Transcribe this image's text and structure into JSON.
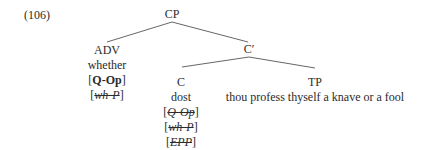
{
  "example_number": "(106)",
  "tree": {
    "root": "CP",
    "adv": {
      "label": "ADV",
      "word": "whether",
      "features": [
        {
          "text": "Q-Op",
          "style": "bold"
        },
        {
          "text": "wh-P",
          "style": "italic-struck"
        }
      ]
    },
    "cbar": "C′",
    "c": {
      "label": "C",
      "word": "dost",
      "features": [
        {
          "text": "Q-Op",
          "style": "italic-struck"
        },
        {
          "text": "wh-P",
          "style": "italic-struck"
        },
        {
          "text": "EPP",
          "style": "italic-struck"
        }
      ]
    },
    "tp": {
      "label": "TP",
      "text": "thou profess thyself a knave or a fool"
    }
  },
  "colors": {
    "text": "#2b2b2b",
    "lines": "#555555"
  }
}
